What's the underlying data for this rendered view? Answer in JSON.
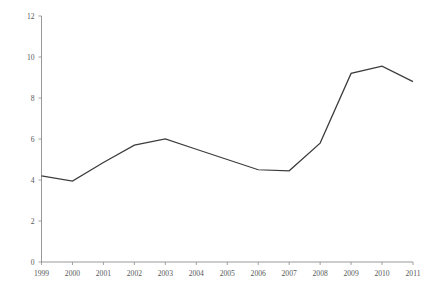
{
  "chart_data": {
    "type": "line",
    "title": "",
    "xlabel": "",
    "ylabel": "Percentage",
    "categories": [
      "1999",
      "2000",
      "2001",
      "2002",
      "2003",
      "2004",
      "2005",
      "2006",
      "2007",
      "2008",
      "2009",
      "2010",
      "2011"
    ],
    "values": [
      4.2,
      3.95,
      4.85,
      5.7,
      6.0,
      5.5,
      5.0,
      4.5,
      4.45,
      5.8,
      9.2,
      9.55,
      8.8
    ],
    "series": [
      {
        "name": "Percentage",
        "values": [
          4.2,
          3.95,
          4.85,
          5.7,
          6.0,
          5.5,
          5.0,
          4.5,
          4.45,
          5.8,
          9.2,
          9.55,
          8.8
        ],
        "color": "#3c3c3c"
      }
    ],
    "ylim": [
      0,
      12
    ],
    "yticks": [
      0,
      2,
      4,
      6,
      8,
      10,
      12
    ],
    "ytick_labels": [
      "0",
      "2",
      "4",
      "6",
      "8",
      "10",
      "12"
    ],
    "xticks": [
      "1999",
      "2000",
      "2001",
      "2002",
      "2003",
      "2004",
      "2005",
      "2006",
      "2007",
      "2008",
      "2009",
      "2010",
      "2011"
    ],
    "grid": false,
    "legend": null,
    "legend_position": "none",
    "line_color": "#3c3c3c",
    "axis_color": "#8c8c8c",
    "background_color": "#ffffff"
  }
}
